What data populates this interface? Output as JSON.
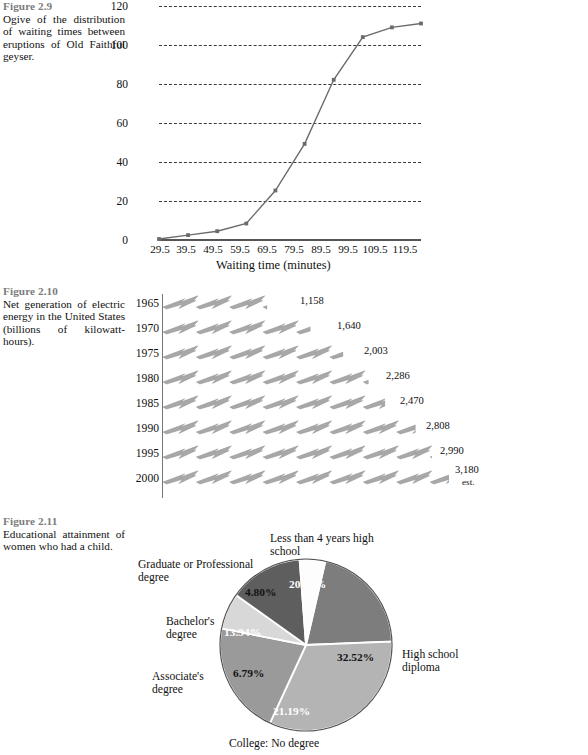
{
  "figures": {
    "fig29": {
      "number": "Figure 2.9",
      "caption": "Ogive of the distribution of waiting times between eruptions of Old Faithful geyser.",
      "chart_data": {
        "type": "line",
        "title": "",
        "xlabel": "Waiting time (minutes)",
        "ylabel": "",
        "x": [
          "29.5",
          "39.5",
          "49.5",
          "59.5",
          "69.5",
          "79.5",
          "89.5",
          "99.5",
          "109.5",
          "119.5"
        ],
        "values": [
          0,
          2,
          4,
          8,
          25,
          49,
          82,
          104,
          109,
          111
        ],
        "ylim": [
          0,
          120
        ],
        "yticks": [
          "0",
          "20",
          "40",
          "60",
          "80",
          "100",
          "120"
        ],
        "grid": true,
        "legend": "none",
        "line_color": "#6b6b6b",
        "marker_color": "#6b6b6b"
      }
    },
    "fig210": {
      "number": "Figure 2.10",
      "caption": "Net generation of electric energy in the United States (billions of kilowatt-hours).",
      "chart_data": {
        "type": "bar",
        "orientation": "horizontal",
        "title": "",
        "xlabel": "",
        "ylabel": "",
        "categories": [
          "1965",
          "1970",
          "1975",
          "1980",
          "1985",
          "1990",
          "1995",
          "2000"
        ],
        "values": [
          1158,
          1640,
          2003,
          2286,
          2470,
          2808,
          2990,
          3180
        ],
        "value_labels": [
          "1,158",
          "1,640",
          "2,003",
          "2,286",
          "2,470",
          "2,808",
          "2,990",
          "3,180"
        ],
        "annotations": [
          "",
          "",
          "",
          "",
          "",
          "",
          "",
          "est."
        ],
        "pictograph_icon": "lightning-bolt-icon",
        "bar_color": "#a8a8a8",
        "grid": false,
        "legend": "none"
      }
    },
    "fig211": {
      "number": "Figure 2.11",
      "caption": "Educational attainment of women who had a child.",
      "chart_data": {
        "type": "pie",
        "title": "",
        "labels": [
          "Less than 4 years high school",
          "High school diploma",
          "College: No degree",
          "Associate's degree",
          "Bachelor's degree",
          "Graduate or Professional degree"
        ],
        "values": [
          20.75,
          32.52,
          21.19,
          6.79,
          13.94,
          4.8
        ],
        "value_labels": [
          "20.75%",
          "32.52%",
          "21.19%",
          "6.79%",
          "13.94%",
          "4.80%"
        ],
        "colors": [
          "#7d7d7d",
          "#b4b4b4",
          "#9a9a9a",
          "#d8d8d8",
          "#5e5e5e",
          "#fdfdfd"
        ],
        "label_text_colors": [
          "#ffffff",
          "#000000",
          "#ffffff",
          "#000000",
          "#ffffff",
          "#000000"
        ],
        "legend": "outside-callouts",
        "start_angle_deg": -77
      }
    }
  }
}
